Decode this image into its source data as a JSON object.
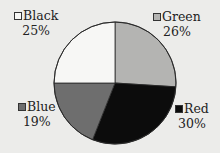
{
  "chart_data": {
    "type": "pie",
    "title": "",
    "start_angle_deg": 90,
    "direction": "clockwise_from_green",
    "slices": [
      {
        "label": "Green",
        "value": 26,
        "pct_label": "26%",
        "color": "#b4b4b2"
      },
      {
        "label": "Red",
        "value": 30,
        "pct_label": "30%",
        "color": "#0c0c0c"
      },
      {
        "label": "Blue",
        "value": 19,
        "pct_label": "19%",
        "color": "#6e6e6e"
      },
      {
        "label": "Black",
        "value": 25,
        "pct_label": "25%",
        "color": "#f7f7f5"
      }
    ],
    "legend_position": "around"
  },
  "legend": {
    "black": {
      "label": "Black",
      "pct": "25%"
    },
    "green": {
      "label": "Green",
      "pct": "26%"
    },
    "blue": {
      "label": "Blue",
      "pct": "19%"
    },
    "red": {
      "label": "Red",
      "pct": "30%"
    }
  }
}
